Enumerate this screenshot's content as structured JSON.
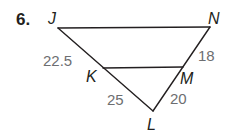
{
  "problem": {
    "number": "6."
  },
  "vertices": {
    "J": {
      "label": "J",
      "x": 58,
      "y": 28
    },
    "N": {
      "label": "N",
      "x": 210,
      "y": 27
    },
    "K": {
      "label": "K",
      "x": 103,
      "y": 68
    },
    "M": {
      "label": "M",
      "x": 183,
      "y": 67
    },
    "L": {
      "label": "L",
      "x": 153,
      "y": 111
    }
  },
  "segments": [
    {
      "from": "J",
      "to": "N"
    },
    {
      "from": "K",
      "to": "M"
    },
    {
      "from": "J",
      "to": "L"
    },
    {
      "from": "N",
      "to": "L"
    }
  ],
  "measures": {
    "JK": "22.5",
    "NM": "18",
    "KL": "25",
    "ML": "20"
  },
  "colors": {
    "line": "#231f20",
    "measure_text": "#6d6e71"
  }
}
